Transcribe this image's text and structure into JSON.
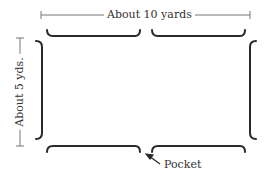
{
  "diagram": {
    "width_label": "About 10 yards",
    "height_label": "About 5 yds.",
    "pocket_label": "Pocket",
    "colors": {
      "lines": "#2a2a2a",
      "dimension": "#666666"
    }
  }
}
